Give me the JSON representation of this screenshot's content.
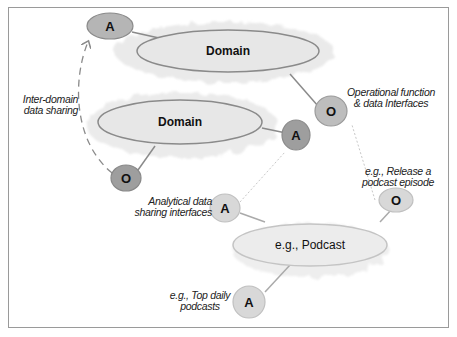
{
  "diagram": {
    "domains": [
      {
        "id": "domain-top",
        "label": "Domain"
      },
      {
        "id": "domain-middle",
        "label": "Domain"
      },
      {
        "id": "domain-podcast",
        "label": "e.g., Podcast"
      }
    ],
    "nodes": {
      "a1": "A",
      "o1": "O",
      "a2": "A",
      "o2": "O",
      "a3": "A",
      "o3": "O",
      "a4": "A"
    },
    "annotations": {
      "inter_domain_line1": "Inter-domain",
      "inter_domain_line2": "data sharing",
      "operational_line1": "Operational function",
      "operational_line2": "& data Interfaces",
      "analytical_line1": "Analytical data",
      "analytical_line2": "sharing interfaces",
      "release_line1": "e.g., Release a",
      "release_line2": "podcast episode",
      "top_daily_line1": "e.g., Top daily",
      "top_daily_line2": "podcasts"
    },
    "colors": {
      "domain_fill": "#e8e8e8",
      "domain_stroke": "#8a8a8a",
      "cloud": "#ececec",
      "node_dark": "#9e9e9e",
      "node_mid": "#b5b5b5",
      "node_light": "#d8d8d8",
      "connector": "#8a8a8a"
    }
  }
}
